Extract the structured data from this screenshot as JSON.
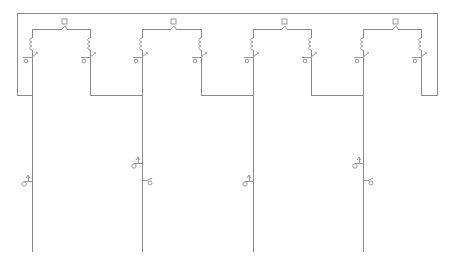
{
  "diagram": {
    "type": "circuit-schematic",
    "width": 451,
    "height": 270,
    "line_color": "#8a8a8a",
    "component_color": "#9a9a9a",
    "background": "#ffffff",
    "outer_loop": {
      "left": 17,
      "right": 437,
      "top": 13,
      "bottom": 95
    },
    "cells": [
      {
        "id": "cell-1",
        "left": 32,
        "right": 90,
        "top": 29,
        "switch_x": 64,
        "feed_y": 95,
        "next_left": 142
      },
      {
        "id": "cell-2",
        "left": 142,
        "right": 201,
        "top": 29,
        "switch_x": 173,
        "feed_y": 95,
        "next_left": 253
      },
      {
        "id": "cell-3",
        "left": 253,
        "right": 311,
        "top": 29,
        "switch_x": 284,
        "feed_y": 95,
        "next_left": 363
      },
      {
        "id": "cell-4",
        "left": 363,
        "right": 421,
        "top": 29,
        "switch_x": 395,
        "feed_y": 95,
        "next_left": 437
      }
    ],
    "drop_lines": [
      {
        "x": 32,
        "y1": 95,
        "y2": 252
      },
      {
        "x": 142,
        "y1": 95,
        "y2": 252
      },
      {
        "x": 253,
        "y1": 95,
        "y2": 252
      },
      {
        "x": 363,
        "y1": 95,
        "y2": 252
      }
    ],
    "left_taps": [
      {
        "x": 32,
        "y": 181
      },
      {
        "x": 142,
        "y": 163
      },
      {
        "x": 253,
        "y": 181
      },
      {
        "x": 363,
        "y": 163
      }
    ],
    "right_taps": [
      {
        "x": 142,
        "y": 180
      },
      {
        "x": 363,
        "y": 180
      }
    ]
  }
}
